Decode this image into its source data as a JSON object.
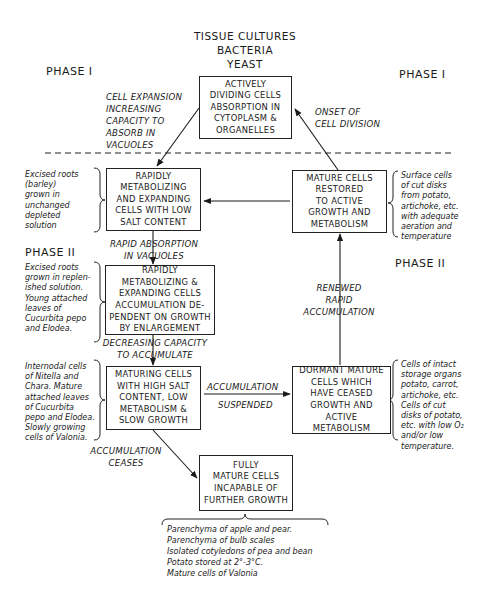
{
  "header": {
    "title_lines": [
      "TISSUE CULTURES",
      "BACTERIA",
      "YEAST"
    ]
  },
  "phases": {
    "left_top": "PHASE I",
    "right_top": "PHASE I",
    "left_mid": "PHASE II",
    "right_mid": "PHASE II"
  },
  "boxes": {
    "actively_dividing": "ACTIVELY\nDIVIDING CELLS\nABSORPTION IN\nCYTOPLASM &\nORGANELLES",
    "rapidly_low_salt": "RAPIDLY\nMETABOLIZING\nAND EXPANDING\nCELLS WITH LOW\nSALT CONTENT",
    "rapidly_accumulation": "RAPIDLY\nMETABOLIZING &\nEXPANDING CELLS\nACCUMULATION DE-\nPENDENT ON GROWTH\nBY ENLARGEMENT",
    "maturing": "MATURING CELLS\nWITH HIGH SALT\nCONTENT, LOW\nMETABOLISM &\nSLOW GROWTH",
    "mature_restored": "MATURE CELLS\nRESTORED\nTO ACTIVE\nGROWTH AND\nMETABOLISM",
    "dormant": "DORMANT MATURE\nCELLS WHICH\nHAVE CEASED\nGROWTH AND\nACTIVE\nMETABOLISM",
    "fully_mature": "FULLY\nMATURE CELLS\nINCAPABLE OF\nFURTHER GROWTH"
  },
  "arrow_labels": {
    "cell_expansion": "CELL EXPANSION\nINCREASING\nCAPACITY TO\nABSORB IN\nVACUOLES",
    "onset_division": "ONSET OF\nCELL DIVISION",
    "rapid_absorption": "RAPID ABSORPTION\nIN VACUOLES",
    "decreasing_capacity": "DECREASING CAPACITY\nTO ACCUMULATE",
    "renewed": "RENEWED\nRAPID\nACCUMULATION",
    "accumulation": "ACCUMULATION",
    "suspended": "SUSPENDED",
    "ceases": "ACCUMULATION\nCEASES"
  },
  "notes": {
    "excised_barley": "Excised roots\n   (barley)\ngrown in\nunchanged\ndepleted\nsolution",
    "excised_replenished": "Excised roots\ngrown in replen-\nished solution.\nYoung attached\nleaves of\nCucurbita pepo\nand Elodea.",
    "internodal": "Internodal cells\nof Nitella and\nChara. Mature\nattached leaves\nof Cucurbita\npepo and Elodea.\nSlowly growing\ncells of Valonia.",
    "surface_cells": "Surface cells\nof cut disks\nfrom potato,\nartichoke, etc.\nwith adequate\naeration and\ntemperature",
    "intact_storage": "Cells of intact\nstorage organs\npotato, carrot,\nartichoke, etc.\nCells of cut\ndisks of potato,\netc. with low O₂\nand/or low\ntemperature.",
    "bottom_list": [
      "Parenchyma of apple and pear.",
      "Parenchyma of bulb scales",
      "Isolated cotyledons of pea and bean",
      "Potato stored at 2°-3°C.",
      "Mature cells of Valonia"
    ]
  }
}
